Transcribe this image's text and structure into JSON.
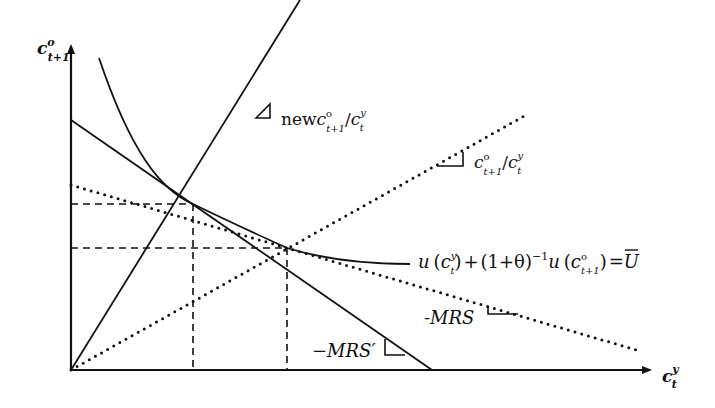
{
  "diagram": {
    "axes": {
      "y_label": {
        "base": "c",
        "sup": "o",
        "sub": "t+1"
      },
      "x_label": {
        "base": "c",
        "sup": "y",
        "sub": "t"
      }
    },
    "rays": [
      {
        "id": "new-ratio-ray",
        "style": "solid",
        "label": {
          "prefix": "new",
          "num_base": "c",
          "num_sup": "o",
          "num_sub": "t+1",
          "slash": "/",
          "den_base": "c",
          "den_sup": "y",
          "den_sub": "t"
        }
      },
      {
        "id": "ratio-ray",
        "style": "dotted",
        "label": {
          "prefix": "",
          "num_base": "c",
          "num_sup": "o",
          "num_sub": "t+1",
          "slash": "/",
          "den_base": "c",
          "den_sup": "y",
          "den_sub": "t"
        }
      }
    ],
    "budget_lines": [
      {
        "id": "mrs-prime-line",
        "style": "solid",
        "label": "−MRS′"
      },
      {
        "id": "mrs-line",
        "style": "dotted",
        "label": "-MRS"
      }
    ],
    "indifference_curve": {
      "label": {
        "u1": "u",
        "open1": "(",
        "c1_base": "c",
        "c1_sup": "y",
        "c1_sub": "t",
        "close1": ")",
        "plus": "+",
        "factor": "(1+θ)",
        "exp": "−1",
        "u2": "u",
        "open2": "(",
        "c2_base": "c",
        "c2_sup": "o",
        "c2_sub": "t+1",
        "close2": ")",
        "eq": "=",
        "ubar": "U"
      }
    },
    "colors": {
      "ink": "#111111",
      "background": "#ffffff"
    }
  }
}
